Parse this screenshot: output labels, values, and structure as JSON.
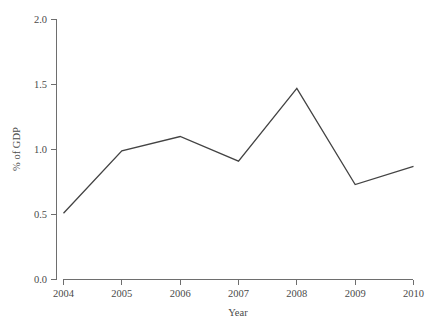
{
  "chart_data": {
    "type": "line",
    "title": "",
    "subtitle": "",
    "xlabel": "Year",
    "ylabel": "% of GDP",
    "x": [
      2004,
      2005,
      2006,
      2007,
      2008,
      2009,
      2010
    ],
    "categories": [
      "2004",
      "2005",
      "2006",
      "2007",
      "2008",
      "2009",
      "2010"
    ],
    "series": [
      {
        "name": "",
        "values": [
          0.51,
          0.99,
          1.1,
          0.91,
          1.47,
          0.73,
          0.87
        ]
      }
    ],
    "xlim": [
      2004,
      2010
    ],
    "ylim": [
      0.0,
      2.0
    ],
    "xticks": [
      2004,
      2005,
      2006,
      2007,
      2008,
      2009,
      2010
    ],
    "xtick_labels": [
      "2004",
      "2005",
      "2006",
      "2007",
      "2008",
      "2009",
      "2010"
    ],
    "yticks": [
      0.0,
      0.5,
      1.0,
      1.5,
      2.0
    ],
    "ytick_labels": [
      "0.0",
      "0.5",
      "1.0",
      "1.5",
      "2.0"
    ],
    "grid": false,
    "legend": false,
    "legend_position": "none",
    "annotations": [],
    "colors": {
      "line": "#434343",
      "axis": "#6e6e6e",
      "text": "#4a4a4a",
      "background": "#ffffff"
    }
  }
}
